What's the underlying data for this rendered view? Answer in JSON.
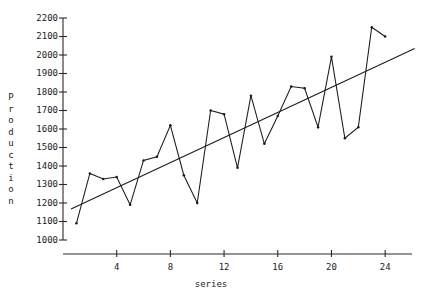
{
  "chart_data": {
    "type": "line",
    "title": "",
    "subtitle": "",
    "xlabel": "series",
    "ylabel": "Production",
    "xlim": [
      0,
      26
    ],
    "ylim": [
      1000,
      2200
    ],
    "grid": false,
    "legend": null,
    "xticks": [
      4,
      8,
      12,
      16,
      20,
      24
    ],
    "yticks": [
      1000,
      1100,
      1200,
      1300,
      1400,
      1500,
      1600,
      1700,
      1800,
      1900,
      2000,
      2100,
      2200
    ],
    "x": [
      1,
      2,
      3,
      4,
      5,
      6,
      7,
      8,
      9,
      10,
      11,
      12,
      13,
      14,
      15,
      16,
      17,
      18,
      19,
      20,
      21,
      22,
      23,
      24
    ],
    "series": [
      {
        "name": "Production",
        "marker": "dot",
        "values": [
          1090,
          1360,
          1330,
          1340,
          1190,
          1430,
          1450,
          1620,
          1350,
          1200,
          1700,
          1680,
          1390,
          1780,
          1520,
          1670,
          1830,
          1820,
          1610,
          1990,
          1550,
          1610,
          2150,
          2100
        ]
      },
      {
        "name": "trend",
        "type": "trendline",
        "x_endpoints": [
          0.6,
          26.2
        ],
        "y_endpoints": [
          1168,
          2035
        ]
      }
    ],
    "annotations": []
  },
  "axes": {
    "y_axis_label_letters": [
      "P",
      "r",
      "o",
      "d",
      "u",
      "c",
      "t",
      "i",
      "o",
      "n"
    ],
    "x_axis_label": "series"
  }
}
